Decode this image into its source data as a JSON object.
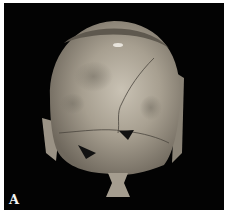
{
  "figure": {
    "panel_label": "A",
    "background_color": "#030303",
    "border_color": "#ffffff"
  }
}
